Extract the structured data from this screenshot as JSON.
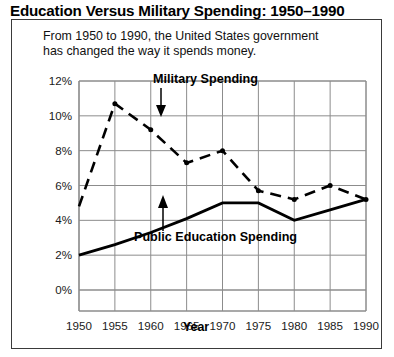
{
  "title": "Education Versus Military Spending: 1950–1990",
  "caption": {
    "line1": "From 1950 to 1990, the United States government",
    "line2": "has changed the way it spends money."
  },
  "axes": {
    "x_title": "Year",
    "x_ticks": [
      "1950",
      "1955",
      "1960",
      "1965",
      "1970",
      "1975",
      "1980",
      "1985",
      "1990"
    ],
    "y_ticks": [
      "0%",
      "2%",
      "4%",
      "6%",
      "8%",
      "10%",
      "12%"
    ]
  },
  "annotations": {
    "military": "Military Spending",
    "education": "Public Education Spending"
  },
  "colors": {
    "ink": "#000000",
    "grid": "#8c8c8c",
    "frame": "#3a3a3a",
    "background": "#ffffff"
  },
  "chart_data": {
    "type": "line",
    "title": "Education Versus Military Spending: 1950–1990",
    "subtitle": "From 1950 to 1990, the United States government has changed the way it spends money.",
    "xlabel": "Year",
    "ylabel": "",
    "x": [
      1950,
      1955,
      1960,
      1965,
      1970,
      1975,
      1980,
      1985,
      1990
    ],
    "xlim": [
      1950,
      1990
    ],
    "ylim": [
      0,
      12
    ],
    "y_tick_values": [
      0,
      2,
      4,
      6,
      8,
      10,
      12
    ],
    "y_unit": "percent",
    "grid": true,
    "legend": "annotations-on-plot",
    "series": [
      {
        "name": "Military Spending",
        "style": "dashed",
        "marker": "dot",
        "values": [
          4.8,
          10.7,
          9.2,
          7.3,
          8.0,
          5.7,
          5.2,
          6.0,
          5.2
        ]
      },
      {
        "name": "Public Education Spending",
        "style": "solid",
        "marker": "none",
        "values": [
          2.0,
          2.6,
          3.3,
          4.1,
          5.0,
          5.0,
          4.0,
          4.6,
          5.2
        ]
      }
    ]
  }
}
